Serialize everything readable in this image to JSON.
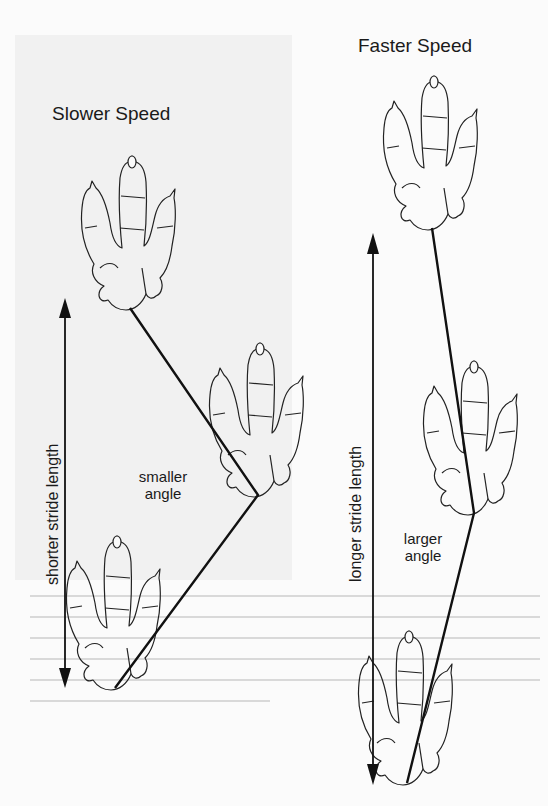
{
  "diagram": {
    "panels": [
      {
        "id": "slower",
        "title": "Slower Speed",
        "stride_label": "shorter stride length",
        "angle_label_line1": "smaller",
        "angle_label_line2": "angle"
      },
      {
        "id": "faster",
        "title": "Faster Speed",
        "stride_label": "longer stride length",
        "angle_label_line1": "larger",
        "angle_label_line2": "angle"
      }
    ],
    "colors": {
      "line": "#111111",
      "outline": "#222222",
      "panel_background": "#f1f1f1",
      "page_background": "#fbfbfb"
    }
  }
}
